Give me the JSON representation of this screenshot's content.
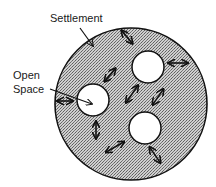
{
  "diagram": {
    "type": "conceptual-land-use",
    "labels": {
      "settlement": "Settlement",
      "open_space_line1": "Open",
      "open_space_line2": "Space"
    },
    "regions": {
      "settlement": {
        "name": "Settlement",
        "pattern": "stippled",
        "color": "#9a9a9a"
      },
      "open_spaces": [
        {
          "name": "open-space-left"
        },
        {
          "name": "open-space-upper-right"
        },
        {
          "name": "open-space-lower-right"
        }
      ]
    },
    "arrow_count": 9,
    "colors": {
      "ink": "#111111",
      "open_space_fill": "#ffffff",
      "stipple_dark": "#6e6e6e",
      "stipple_light": "#d6d6d6"
    }
  }
}
